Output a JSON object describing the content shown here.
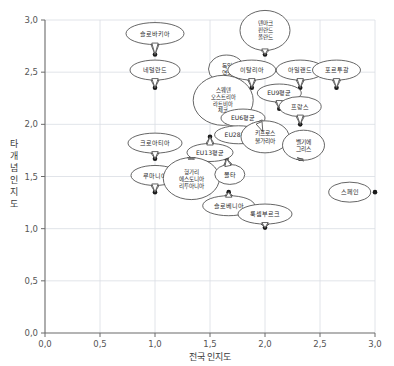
{
  "chart_data": {
    "type": "scatter",
    "title": "",
    "xlabel": "전국 인지도",
    "ylabel": "타 개념 인지도",
    "xlim": [
      0.0,
      3.0
    ],
    "ylim": [
      0.0,
      3.0
    ],
    "xticks": [
      "0,0",
      "0,5",
      "1,0",
      "1,5",
      "2,0",
      "2,5",
      "3,0"
    ],
    "yticks": [
      "0,0",
      "0,5",
      "1,0",
      "1,5",
      "2,0",
      "2,5",
      "3,0"
    ],
    "xtick_values": [
      0.0,
      0.5,
      1.0,
      1.5,
      2.0,
      2.5,
      3.0
    ],
    "ytick_values": [
      0.0,
      0.5,
      1.0,
      1.5,
      2.0,
      2.5,
      3.0
    ],
    "grid": true,
    "legend": "none",
    "points": [
      {
        "label": "슬로바키아",
        "lines": [
          "슬로바키아"
        ],
        "x": 1.0,
        "y": 2.67,
        "lx": 1.0,
        "ly": 2.87,
        "rx": 29,
        "ry": 11,
        "tail": "down"
      },
      {
        "label": "네덜란드",
        "lines": [
          "네덜란드"
        ],
        "x": 1.0,
        "y": 2.35,
        "lx": 1.0,
        "ly": 2.52,
        "rx": 25,
        "ry": 10,
        "tail": "down"
      },
      {
        "label": "덴마크/핀란드/폴란드",
        "lines": [
          "덴마크",
          "핀란드",
          "폴란드"
        ],
        "x": 2.0,
        "y": 2.67,
        "lx": 2.0,
        "ly": 2.9,
        "rx": 25,
        "ry": 20,
        "tail": "down"
      },
      {
        "label": "독일/영국",
        "lines": [
          "독일",
          "영국"
        ],
        "x": 1.65,
        "y": 2.35,
        "lx": 1.65,
        "ly": 2.53,
        "rx": 18,
        "ry": 14,
        "tail": "down"
      },
      {
        "label": "이탈리아",
        "lines": [
          "이탈리아"
        ],
        "x": 1.88,
        "y": 2.35,
        "lx": 1.88,
        "ly": 2.52,
        "rx": 24,
        "ry": 10,
        "tail": "down"
      },
      {
        "label": "아일랜드",
        "lines": [
          "아일랜드"
        ],
        "x": 2.32,
        "y": 2.35,
        "lx": 2.32,
        "ly": 2.52,
        "rx": 24,
        "ry": 10,
        "tail": "down"
      },
      {
        "label": "포르투갈",
        "lines": [
          "포르투갈"
        ],
        "x": 2.65,
        "y": 2.35,
        "lx": 2.65,
        "ly": 2.52,
        "rx": 24,
        "ry": 10,
        "tail": "down"
      },
      {
        "label": "EU9평균",
        "lines": [
          "EU9평균"
        ],
        "x": 2.13,
        "y": 2.15,
        "lx": 2.13,
        "ly": 2.3,
        "rx": 22,
        "ry": 9,
        "tail": "down"
      },
      {
        "label": "스웨덴/오스트리아/라트비아/체코",
        "lines": [
          "스웨덴",
          "오스트리아",
          "라트비아",
          "체코"
        ],
        "x": 1.78,
        "y": 2.0,
        "lx": 1.62,
        "ly": 2.23,
        "rx": 30,
        "ry": 25,
        "tail": "down-right"
      },
      {
        "label": "프랑스",
        "lines": [
          "프랑스"
        ],
        "x": 2.32,
        "y": 2.0,
        "lx": 2.32,
        "ly": 2.17,
        "rx": 21,
        "ry": 10,
        "tail": "down"
      },
      {
        "label": "EU6평균",
        "lines": [
          "EU6평균"
        ],
        "x": 1.92,
        "y": 1.93,
        "lx": 1.8,
        "ly": 2.06,
        "rx": 22,
        "ry": 9,
        "tail": "down-right"
      },
      {
        "label": "EU28평균",
        "lines": [
          "EU28평균"
        ],
        "x": 1.83,
        "y": 1.93,
        "lx": 1.76,
        "ly": 1.9,
        "rx": 24,
        "ry": 9,
        "tail": "up-right"
      },
      {
        "label": "키프로스/불가리아",
        "lines": [
          "키프로스",
          "불가리아"
        ],
        "x": 1.98,
        "y": 1.93,
        "lx": 2.0,
        "ly": 1.88,
        "rx": 24,
        "ry": 16,
        "tail": "up-left"
      },
      {
        "label": "EU13평균",
        "lines": [
          "EU13평균"
        ],
        "x": 1.5,
        "y": 1.88,
        "lx": 1.5,
        "ly": 1.73,
        "rx": 23,
        "ry": 9,
        "tail": "up"
      },
      {
        "label": "크로아티아",
        "lines": [
          "크로아티아"
        ],
        "x": 1.0,
        "y": 1.67,
        "lx": 1.0,
        "ly": 1.82,
        "rx": 27,
        "ry": 10,
        "tail": "down"
      },
      {
        "label": "벨기에/그리스",
        "lines": [
          "벨기에",
          "그리스"
        ],
        "x": 2.32,
        "y": 1.67,
        "lx": 2.35,
        "ly": 1.8,
        "rx": 21,
        "ry": 15,
        "tail": "down-left"
      },
      {
        "label": "루마니아",
        "lines": [
          "루마니아"
        ],
        "x": 1.0,
        "y": 1.35,
        "lx": 1.0,
        "ly": 1.51,
        "rx": 24,
        "ry": 10,
        "tail": "down"
      },
      {
        "label": "헝가리/에스토니아/리투아니아",
        "lines": [
          "헝가리",
          "에스토니아",
          "리투아니아"
        ],
        "x": 1.33,
        "y": 1.67,
        "lx": 1.33,
        "ly": 1.48,
        "rx": 28,
        "ry": 21,
        "tail": "up"
      },
      {
        "label": "몰타",
        "lines": [
          "몰타"
        ],
        "x": 1.65,
        "y": 1.67,
        "lx": 1.68,
        "ly": 1.52,
        "rx": 15,
        "ry": 10,
        "tail": "up-left"
      },
      {
        "label": "슬로베니아",
        "lines": [
          "슬로베니아"
        ],
        "x": 1.67,
        "y": 1.35,
        "lx": 1.67,
        "ly": 1.22,
        "rx": 26,
        "ry": 10,
        "tail": "up"
      },
      {
        "label": "룩셈부르크",
        "lines": [
          "룩셈부르크"
        ],
        "x": 2.0,
        "y": 1.01,
        "lx": 2.0,
        "ly": 1.14,
        "rx": 27,
        "ry": 10,
        "tail": "down"
      },
      {
        "label": "스페인",
        "lines": [
          "스페인"
        ],
        "x": 3.0,
        "y": 1.35,
        "lx": 2.77,
        "ly": 1.35,
        "rx": 21,
        "ry": 10,
        "tail": "none"
      }
    ]
  },
  "colors": {
    "grid": "#d9dde3",
    "axis": "#6b6b6b",
    "point": "#1a1a1a",
    "bubble_stroke": "#4a4a4a",
    "bubble_fill": "#ffffff",
    "text": "#3a3a3a"
  }
}
